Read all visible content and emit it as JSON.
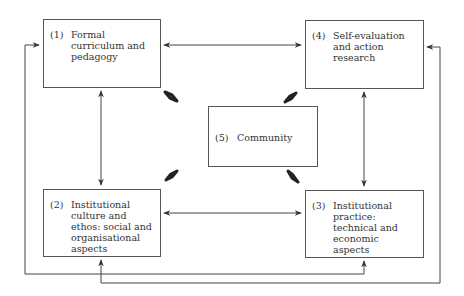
{
  "diagram": {
    "boxes": [
      {
        "id": "1",
        "num": "(1)",
        "label": "Formal curriculum and pedagogy"
      },
      {
        "id": "4",
        "num": "(4)",
        "label": "Self-evaluation and action research"
      },
      {
        "id": "5",
        "num": "(5)",
        "label": "Community"
      },
      {
        "id": "2",
        "num": "(2)",
        "label": "Institutional culture and ethos: social and organisational aspects"
      },
      {
        "id": "3",
        "num": "(3)",
        "label": "Institutional practice: technical and economic aspects"
      }
    ],
    "connections": [
      {
        "from": "1",
        "to": "4",
        "type": "bidirectional"
      },
      {
        "from": "1",
        "to": "2",
        "type": "bidirectional"
      },
      {
        "from": "4",
        "to": "3",
        "type": "bidirectional"
      },
      {
        "from": "2",
        "to": "3",
        "type": "bidirectional"
      },
      {
        "from": "5",
        "to": "1",
        "type": "bidirectional"
      },
      {
        "from": "5",
        "to": "4",
        "type": "bidirectional"
      },
      {
        "from": "5",
        "to": "2",
        "type": "bidirectional"
      },
      {
        "from": "5",
        "to": "3",
        "type": "bidirectional"
      },
      {
        "from": "1",
        "to": "3",
        "type": "bidirectional",
        "route": "outer-left-bottom"
      },
      {
        "from": "2",
        "to": "4",
        "type": "bidirectional",
        "route": "outer-bottom-right"
      }
    ],
    "colors": {
      "line": "#444444",
      "box_border": "#555555",
      "text": "#333333"
    }
  }
}
